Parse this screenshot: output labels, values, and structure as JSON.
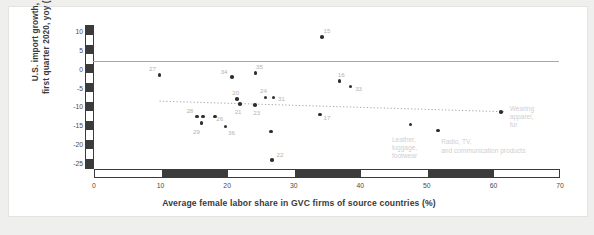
{
  "chart_data": {
    "type": "scatter",
    "title": "",
    "xlabel": "Average female labor share in GVC firms of source countries  (%)",
    "ylabel": "U.S. import growth,\nfirst quarter 2020, yoy (%)",
    "ylabel_line1": "U.S. import growth,",
    "ylabel_line2": "first quarter 2020, yoy (%)",
    "xlim": [
      0,
      70
    ],
    "ylim": [
      -26.5,
      11.5
    ],
    "xticks": [
      "0",
      "10",
      "20",
      "30",
      "40",
      "50",
      "60",
      "70"
    ],
    "xtick_values": [
      0,
      10,
      20,
      30,
      40,
      50,
      60,
      70
    ],
    "yticks": [
      "10",
      "5",
      "0",
      "-5",
      "-10",
      "-15",
      "-20",
      "-25"
    ],
    "ytick_values": [
      10,
      5,
      0,
      -5,
      -10,
      -15,
      -20,
      -25
    ],
    "grid": false,
    "legend": "none",
    "reference_line": {
      "orientation": "horizontal",
      "y": 2.0,
      "color": "#a7a7a7",
      "style": "solid"
    },
    "trend_line": {
      "style": "dotted",
      "color": "#9a9a9a",
      "x_start": 10.0,
      "y_start": -8.6,
      "x_end": 62.0,
      "y_end": -11.4
    },
    "points": [
      {
        "label": "27",
        "x": 10.0,
        "y": -1.7,
        "label_dx": -7,
        "label_dy": -7
      },
      {
        "label": "34",
        "x": 20.9,
        "y": -2.3,
        "label_dx": -8,
        "label_dy": -6
      },
      {
        "label": "35",
        "x": 24.4,
        "y": -1.1,
        "label_dx": 4,
        "label_dy": -7
      },
      {
        "label": "15",
        "x": 34.4,
        "y": 8.4,
        "label_dx": 5,
        "label_dy": -7
      },
      {
        "label": "16",
        "x": 37.0,
        "y": -3.3,
        "label_dx": 2,
        "label_dy": -7
      },
      {
        "label": "33",
        "x": 38.7,
        "y": -4.7,
        "label_dx": 8,
        "label_dy": 2
      },
      {
        "label": "20",
        "x": 21.6,
        "y": -8.1,
        "label_dx": -1,
        "label_dy": -7
      },
      {
        "label": "21",
        "x": 22.1,
        "y": -9.3,
        "label_dx": -2,
        "label_dy": 7
      },
      {
        "label": "24",
        "x": 25.9,
        "y": -7.6,
        "label_dx": -2,
        "label_dy": -7
      },
      {
        "label": "31",
        "x": 27.1,
        "y": -7.6,
        "label_dx": 8,
        "label_dy": 1
      },
      {
        "label": "23",
        "x": 24.3,
        "y": -9.6,
        "label_dx": 2,
        "label_dy": 7
      },
      {
        "label": "28",
        "x": 15.6,
        "y": -12.6,
        "label_dx": -7,
        "label_dy": -6
      },
      {
        "label": "",
        "x": 16.5,
        "y": -12.6,
        "label_dx": 0,
        "label_dy": 0
      },
      {
        "label": "26",
        "x": 18.3,
        "y": -12.6,
        "label_dx": 5,
        "label_dy": 2
      },
      {
        "label": "29",
        "x": 16.3,
        "y": -14.4,
        "label_dx": -5,
        "label_dy": 8
      },
      {
        "label": "36",
        "x": 19.9,
        "y": -15.3,
        "label_dx": 6,
        "label_dy": 5
      },
      {
        "label": "17",
        "x": 34.1,
        "y": -12.1,
        "label_dx": 7,
        "label_dy": 3
      },
      {
        "label": "",
        "x": 26.7,
        "y": -16.6,
        "label_dx": 0,
        "label_dy": 0
      },
      {
        "label": "22",
        "x": 26.9,
        "y": -24.2,
        "label_dx": 8,
        "label_dy": -6
      },
      {
        "label": "",
        "x": 47.7,
        "y": -14.8,
        "label_dx": 0,
        "label_dy": 0
      },
      {
        "label": "",
        "x": 51.8,
        "y": -16.3,
        "label_dx": 0,
        "label_dy": 0
      },
      {
        "label": "",
        "x": 61.3,
        "y": -11.4,
        "label_dx": 0,
        "label_dy": 0
      }
    ],
    "annotations": [
      {
        "name": "wearing-apparel-fur",
        "text": "Wearing apparel,\nfur",
        "x": 62.6,
        "y": -9.6
      },
      {
        "name": "leather-luggage-footwear",
        "text": "Leather,\nluggage,\nfootwear",
        "x": 44.9,
        "y": -17.7
      },
      {
        "name": "radio-tv-communication",
        "text": "Radio, TV,\nand communication products",
        "x": 52.3,
        "y": -18.4
      }
    ]
  },
  "colors": {
    "page_background": "#efefee",
    "card_background": "#ffffff",
    "point": "#2e2e2e",
    "axis_band_dark": "#3b3b3b",
    "reference_line": "#a7a7a7",
    "trend_line": "#9a9a9a",
    "point_label": "#b3b3b3",
    "annotation": "#cfcfcf",
    "axis_text": "#4a4a4a",
    "title_text": "#3a3a3a"
  }
}
